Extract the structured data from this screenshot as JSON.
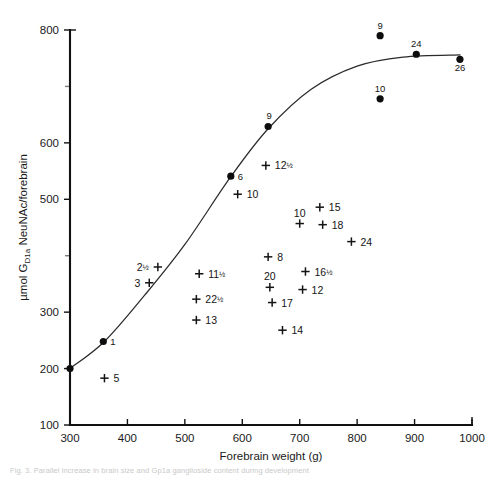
{
  "chart_data": {
    "type": "scatter",
    "title": "",
    "xlabel": "Forebrain weight (g)",
    "ylabel": "µmol G_D1a NeuNAc/forebrain",
    "ylabel_parts": {
      "pre": "µmol G",
      "sub": "D1a",
      "post": " NeuNAc/forebrain"
    },
    "xlim": [
      300,
      1000
    ],
    "ylim": [
      100,
      800
    ],
    "xticks": [
      300,
      400,
      500,
      600,
      700,
      800,
      900,
      1000
    ],
    "yticks": [
      100,
      200,
      300,
      500,
      600,
      800
    ],
    "ytick_labels": [
      "100",
      "200",
      "300",
      "500",
      "600",
      "800"
    ],
    "xtick_labels": [
      "300",
      "400",
      "500",
      "600",
      "700",
      "800",
      "900",
      "1000"
    ],
    "grid": false,
    "legend": "none",
    "series": [
      {
        "name": "fitted-curve",
        "marker": "line",
        "points": [
          {
            "x": 300,
            "y": 200
          },
          {
            "x": 360,
            "y": 248
          },
          {
            "x": 430,
            "y": 330
          },
          {
            "x": 500,
            "y": 420
          },
          {
            "x": 580,
            "y": 540
          },
          {
            "x": 645,
            "y": 625
          },
          {
            "x": 720,
            "y": 695
          },
          {
            "x": 800,
            "y": 736
          },
          {
            "x": 880,
            "y": 752
          },
          {
            "x": 980,
            "y": 756
          }
        ]
      },
      {
        "name": "filled-circles",
        "marker": "dot",
        "points": [
          {
            "x": 300,
            "y": 200,
            "label": ""
          },
          {
            "x": 358,
            "y": 248,
            "label": "1"
          },
          {
            "x": 580,
            "y": 541,
            "label": "6"
          },
          {
            "x": 645,
            "y": 629,
            "label": "9"
          },
          {
            "x": 840,
            "y": 790,
            "label": "9"
          },
          {
            "x": 840,
            "y": 678,
            "label": "10"
          },
          {
            "x": 903,
            "y": 757,
            "label": "24"
          },
          {
            "x": 979,
            "y": 748,
            "label": "26"
          }
        ]
      },
      {
        "name": "plus-markers",
        "marker": "plus",
        "points": [
          {
            "x": 360,
            "y": 183,
            "label": "5"
          },
          {
            "x": 453,
            "y": 380,
            "label": "2",
            "frac": "½",
            "label_side": "left"
          },
          {
            "x": 438,
            "y": 352,
            "label": "3",
            "label_side": "left"
          },
          {
            "x": 520,
            "y": 323,
            "label": "22",
            "frac": "½"
          },
          {
            "x": 520,
            "y": 286,
            "label": "13"
          },
          {
            "x": 525,
            "y": 368,
            "label": "11",
            "frac": "½"
          },
          {
            "x": 592,
            "y": 509,
            "label": "10"
          },
          {
            "x": 641,
            "y": 560,
            "label": "12",
            "frac": "½"
          },
          {
            "x": 645,
            "y": 398,
            "label": "8"
          },
          {
            "x": 648,
            "y": 344,
            "label": "20",
            "label_side": "above"
          },
          {
            "x": 652,
            "y": 317,
            "label": "17"
          },
          {
            "x": 670,
            "y": 268,
            "label": "14"
          },
          {
            "x": 700,
            "y": 457,
            "label": "10",
            "label_side": "above"
          },
          {
            "x": 735,
            "y": 486,
            "label": "15"
          },
          {
            "x": 740,
            "y": 455,
            "label": "18"
          },
          {
            "x": 710,
            "y": 372,
            "label": "16",
            "frac": "½"
          },
          {
            "x": 705,
            "y": 340,
            "label": "12"
          },
          {
            "x": 790,
            "y": 425,
            "label": "24"
          }
        ]
      }
    ]
  },
  "caption": {
    "text": "Fig. 3.  Parallel increase in brain size and Gp1a ganglioside content during development"
  }
}
